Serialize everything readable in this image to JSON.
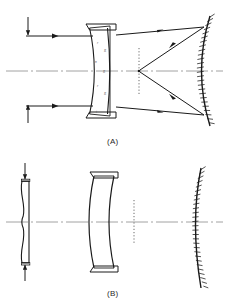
{
  "figure": {
    "background_color": "#ffffff",
    "ink_color": "#1a1a1a",
    "axis_color": "#7a7a7a",
    "hatch_color": "#1a1a1a",
    "panels": [
      {
        "id": "A",
        "label": "(A)",
        "caption_x": 114,
        "caption_y": 140,
        "axis_y": 71,
        "axis_x1": 6,
        "axis_x2": 223,
        "aperture_arrows": [
          {
            "name": "top-aperture-arrow",
            "x": 28,
            "y1": 18,
            "y2": 36,
            "direction": "down"
          },
          {
            "name": "bottom-aperture-arrow",
            "x": 28,
            "y1": 122,
            "y2": 104,
            "direction": "up"
          }
        ],
        "incoming_rays": [
          {
            "y": 36,
            "x1": 26,
            "x2": 92,
            "arrow_at": 60
          },
          {
            "y": 106,
            "x1": 26,
            "x2": 92,
            "arrow_at": 60
          }
        ],
        "corrector": {
          "name": "meniscus-corrector-lens",
          "type": "meniscus",
          "top_y": 24,
          "bottom_y": 118,
          "flat_face_x": 110,
          "curve_apex_x": 92,
          "flange_left_x": 86,
          "flange_right_x": 116,
          "flange_height": 6
        },
        "focal_surface": {
          "name": "focal-surface",
          "x": 139,
          "y1": 48,
          "y2": 96,
          "style": "dotted"
        },
        "focus_point": {
          "x": 139,
          "y": 71
        },
        "mirror": {
          "name": "concave-primary-mirror",
          "top_y": 16,
          "bottom_y": 126,
          "apex_x": 196,
          "edge_x": 210,
          "hatched_side": "right",
          "hatch_count": 26
        },
        "reflected_rays": [
          {
            "from_x": 116,
            "from_y": 36,
            "to_x": 205,
            "to_y": 28,
            "arrow_at": 0.55
          },
          {
            "from_x": 205,
            "from_y": 28,
            "to_x": 139,
            "to_y": 71,
            "arrow_at": 0.55
          },
          {
            "from_x": 116,
            "from_y": 106,
            "to_x": 205,
            "to_y": 114,
            "arrow_at": 0.55
          },
          {
            "from_x": 205,
            "from_y": 114,
            "to_x": 139,
            "to_y": 71,
            "arrow_at": 0.55
          }
        ],
        "annotations": [
          {
            "text": "r",
            "x": 99,
            "y": 44
          },
          {
            "text": "R",
            "x": 107,
            "y": 52
          },
          {
            "text": "n",
            "x": 97,
            "y": 62
          },
          {
            "text": "R",
            "x": 106,
            "y": 72
          },
          {
            "text": "r",
            "x": 99,
            "y": 86
          },
          {
            "text": "R",
            "x": 107,
            "y": 94
          },
          {
            "text": "t",
            "x": 98,
            "y": 112
          }
        ]
      },
      {
        "id": "B",
        "label": "(B)",
        "caption_x": 114,
        "caption_y": 292,
        "axis_y": 222,
        "axis_x1": 6,
        "axis_x2": 223,
        "aperture_arrows": [
          {
            "name": "top-aperture-arrow",
            "x": 24,
            "y1": 164,
            "y2": 180,
            "direction": "down"
          },
          {
            "name": "bottom-aperture-arrow",
            "x": 24,
            "y1": 280,
            "y2": 264,
            "direction": "up"
          }
        ],
        "corrector_plate": {
          "name": "schmidt-corrector-plate",
          "top_y": 180,
          "bottom_y": 264,
          "flat_face_x": 28,
          "profile_x": 20,
          "thickness": 4
        },
        "meniscus": {
          "name": "meniscus-lens",
          "top_y": 172,
          "bottom_y": 272,
          "front_apex_x": 92,
          "back_apex_x": 112,
          "flange_left_x": 90,
          "flange_right_x": 118,
          "flange_height": 6
        },
        "focal_surface": {
          "name": "focal-surface",
          "x": 134,
          "y1": 200,
          "y2": 244,
          "style": "dotted"
        },
        "mirror": {
          "name": "concave-primary-mirror",
          "top_y": 168,
          "bottom_y": 288,
          "apex_x": 194,
          "edge_x": 204,
          "hatched_side": "right",
          "hatch_count": 28
        }
      }
    ]
  }
}
